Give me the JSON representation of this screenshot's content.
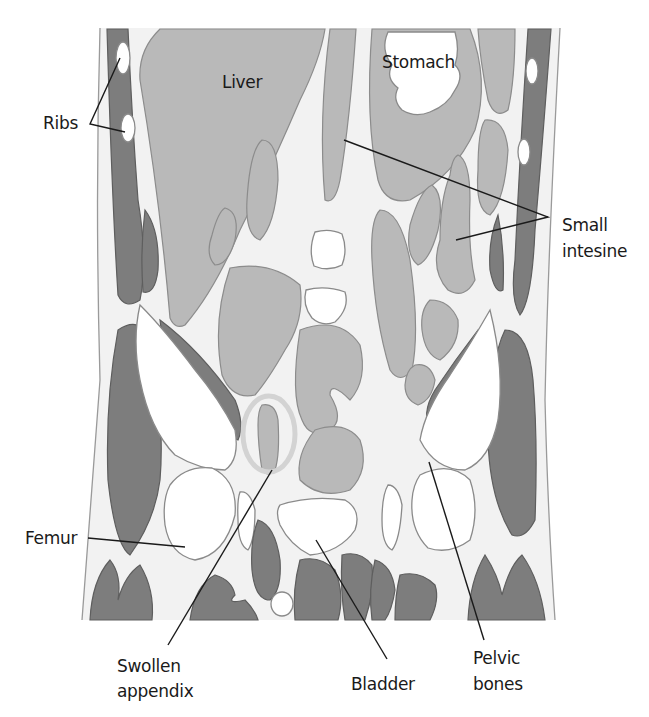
{
  "diagram": {
    "colors": {
      "background": "#ffffff",
      "tissue": "#f2f2f2",
      "organ_gray": "#b9b9b9",
      "muscle_dark": "#7d7d7d",
      "bone_white": "#ffffff",
      "appendix_highlight": "#d6d6d6",
      "label_text": "#1a1a1a"
    },
    "labels": {
      "liver": "Liver",
      "stomach": "Stomach",
      "ribs": "Ribs",
      "small_intestine_line1": "Small",
      "small_intestine_line2": "intesine",
      "femur": "Femur",
      "swollen_appendix_line1": "Swollen",
      "swollen_appendix_line2": "appendix",
      "bladder": "Bladder",
      "pelvic_bones_line1": "Pelvic",
      "pelvic_bones_line2": "bones"
    }
  }
}
